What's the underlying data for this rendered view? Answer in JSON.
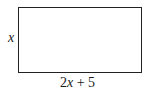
{
  "diagram": {
    "shape": "rectangle",
    "side_label": "x",
    "bottom_label": {
      "coefficient": "2",
      "variable": "x",
      "rest": " + 5",
      "full": "2x + 5"
    }
  }
}
